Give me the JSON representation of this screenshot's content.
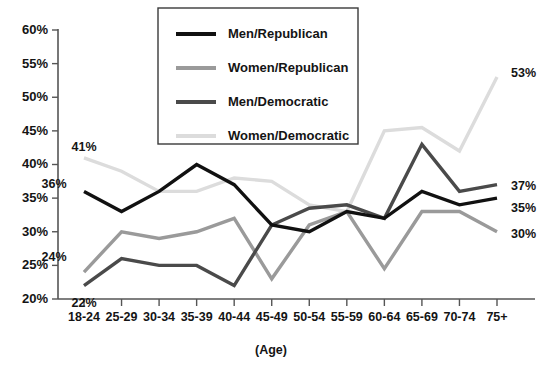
{
  "chart_data": {
    "type": "line",
    "title": "",
    "xlabel": "(Age)",
    "ylabel": "",
    "categories": [
      "18-24",
      "25-29",
      "30-34",
      "35-39",
      "40-44",
      "45-49",
      "50-54",
      "55-59",
      "60-64",
      "65-69",
      "70-74",
      "75+"
    ],
    "ylim": [
      20,
      60
    ],
    "ytick_labels": [
      "20%",
      "25%",
      "30%",
      "35%",
      "40%",
      "45%",
      "50%",
      "55%",
      "60%"
    ],
    "ytick_values": [
      20,
      25,
      30,
      35,
      40,
      45,
      50,
      55,
      60
    ],
    "grid": false,
    "legend_position": "top-center",
    "series": [
      {
        "name": "Men/Republican",
        "color": "#111111",
        "width": 3.4,
        "values": [
          36,
          33,
          36,
          40,
          37,
          31,
          30,
          33,
          32,
          36,
          34,
          35
        ],
        "start_label": "36%",
        "end_label": "35%"
      },
      {
        "name": "Women/Republican",
        "color": "#9a9a9a",
        "width": 3.4,
        "values": [
          24,
          30,
          29,
          30,
          32,
          23,
          31,
          33,
          24.5,
          33,
          33,
          30
        ],
        "start_label": "24%",
        "end_label": "30%"
      },
      {
        "name": "Men/Democratic",
        "color": "#4a4a4a",
        "width": 3.4,
        "values": [
          22,
          26,
          25,
          25,
          22,
          31,
          33.5,
          34,
          32,
          43,
          36,
          37
        ],
        "start_label": "22%",
        "end_label": "37%"
      },
      {
        "name": "Women/Democratic",
        "color": "#dcdcdc",
        "width": 3.4,
        "values": [
          41,
          39,
          36,
          36,
          38,
          37.5,
          34,
          33,
          45,
          45.5,
          42,
          53
        ],
        "start_label": "41%",
        "end_label": "53%"
      }
    ],
    "annotations": [
      {
        "text": "41%",
        "x": 84,
        "y": 151
      },
      {
        "text": "36%",
        "x": 54,
        "y": 188
      },
      {
        "text": "24%",
        "x": 54,
        "y": 261
      },
      {
        "text": "22%",
        "x": 84,
        "y": 307
      },
      {
        "text": "53%",
        "x": 511,
        "y": 77
      },
      {
        "text": "37%",
        "x": 511,
        "y": 190
      },
      {
        "text": "35%",
        "x": 511,
        "y": 212
      },
      {
        "text": "30%",
        "x": 511,
        "y": 238
      }
    ]
  },
  "legend": {
    "entries": [
      {
        "label": "Men/Republican"
      },
      {
        "label": "Women/Republican"
      },
      {
        "label": "Men/Democratic"
      },
      {
        "label": "Women/Democratic"
      }
    ]
  }
}
